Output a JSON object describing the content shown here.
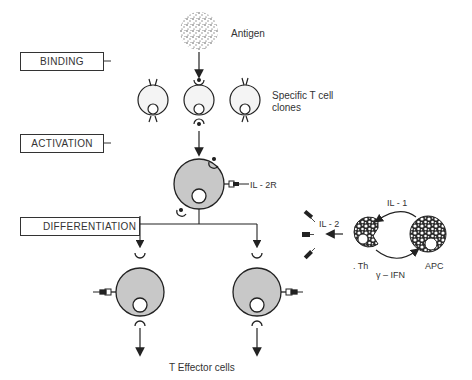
{
  "stages": {
    "binding": "BINDING",
    "activation": "ACTIVATION",
    "differentiation": "DIFFERENTIATION"
  },
  "labels": {
    "antigen": "Antigen",
    "specific_t_cell_line1": "Specific T cell",
    "specific_t_cell_line2": "clones",
    "il2r": "IL - 2R",
    "il2": "IL - 2",
    "il1": "IL - 1",
    "th": ". Th",
    "apc": "APC",
    "ifn": "γ – IFN",
    "t_effector": "T Effector cells"
  },
  "colors": {
    "line": "#222222",
    "activated_cell_fill": "#c8c8c8",
    "resting_cell_fill": "#f4f4f4"
  }
}
